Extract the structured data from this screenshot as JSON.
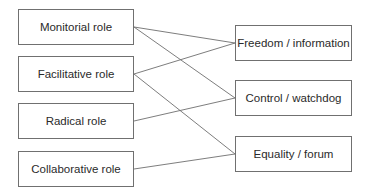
{
  "diagram": {
    "left_nodes": [
      {
        "id": "monitorial",
        "label": "Monitorial role"
      },
      {
        "id": "facilitative",
        "label": "Facilitative role"
      },
      {
        "id": "radical",
        "label": "Radical role"
      },
      {
        "id": "collaborative",
        "label": "Collaborative role"
      }
    ],
    "right_nodes": [
      {
        "id": "freedom",
        "label": "Freedom / information"
      },
      {
        "id": "control",
        "label": "Control / watchdog"
      },
      {
        "id": "equality",
        "label": "Equality / forum"
      }
    ],
    "edges": [
      {
        "from": "monitorial",
        "to": "freedom"
      },
      {
        "from": "monitorial",
        "to": "control"
      },
      {
        "from": "facilitative",
        "to": "freedom"
      },
      {
        "from": "facilitative",
        "to": "equality"
      },
      {
        "from": "radical",
        "to": "control"
      },
      {
        "from": "collaborative",
        "to": "equality"
      }
    ],
    "colors": {
      "line": "#6e6e6e",
      "border": "#707070",
      "text": "#2a2a2a"
    }
  }
}
